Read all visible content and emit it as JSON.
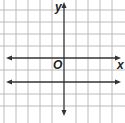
{
  "diagram": {
    "type": "coordinate-plane",
    "axes": {
      "x_label": "x",
      "y_label": "y",
      "origin_label": "O"
    },
    "grid": {
      "spacing_units": 1,
      "x_range": [
        -5,
        5
      ],
      "y_range": [
        -4,
        5
      ]
    },
    "lines": [
      {
        "name": "horizontal-line",
        "equation": "y = -2",
        "arrows": "both"
      }
    ],
    "colors": {
      "grid": "#b0b0b0",
      "axis": "#333333",
      "line": "#333333"
    }
  }
}
